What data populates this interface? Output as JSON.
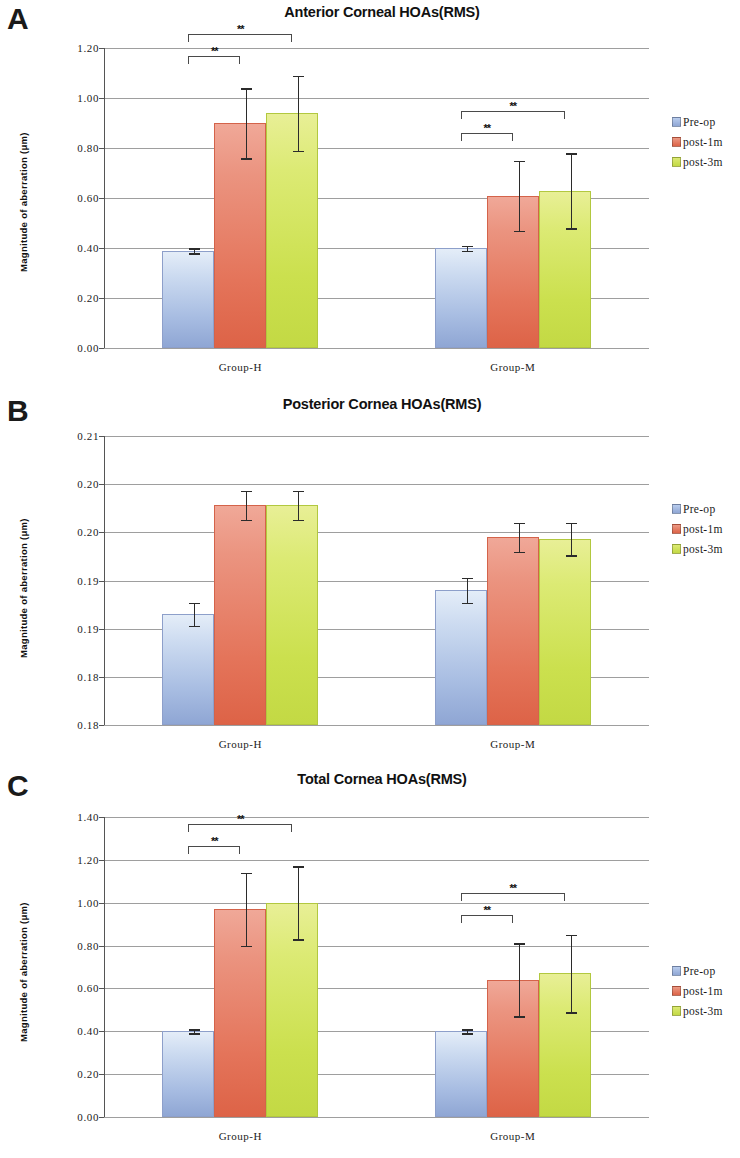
{
  "figure": {
    "panels": [
      "A",
      "B",
      "C"
    ],
    "series_names": [
      "Pre-op",
      "post-1m",
      "post-3m"
    ],
    "legend_labels": {
      "pre": "Pre-op",
      "p1m": "post-1m",
      "p3m": "post-3m"
    },
    "colors": {
      "pre_op": "#a8bde2",
      "post_1m": "#e4745a",
      "post_3m": "#cbe04e"
    },
    "significance_marker": "**",
    "ylabel": "Magnitude of aberration (μm)",
    "categories": [
      "Group-H",
      "Group-M"
    ]
  },
  "panel_a": {
    "letter": "A",
    "title": "Anterior Corneal HOAs(RMS)",
    "ylabel": "Magnitude of aberration (μm)",
    "ticks": [
      "1.20",
      "1.00",
      "0.80",
      "0.60",
      "0.40",
      "0.20",
      "0.00"
    ],
    "cat_h": "Group-H",
    "cat_m": "Group-M"
  },
  "panel_b": {
    "letter": "B",
    "title": "Posterior Cornea HOAs(RMS)",
    "ylabel": "Magnitude of aberration (μm)",
    "ticks": [
      "0.21",
      "0.20",
      "0.20",
      "0.19",
      "0.19",
      "0.18",
      "0.18"
    ],
    "cat_h": "Group-H",
    "cat_m": "Group-M"
  },
  "panel_c": {
    "letter": "C",
    "title": "Total Cornea HOAs(RMS)",
    "ylabel": "Magnitude of aberration (μm)",
    "ticks": [
      "1.40",
      "1.20",
      "1.00",
      "0.80",
      "0.60",
      "0.40",
      "0.20",
      "0.00"
    ],
    "cat_h": "Group-H",
    "cat_m": "Group-M"
  },
  "chart_data": [
    {
      "panel": "A",
      "type": "bar",
      "title": "Anterior Corneal HOAs(RMS)",
      "xlabel": "",
      "ylabel": "Magnitude of aberration (μm)",
      "ylim": [
        0.0,
        1.2
      ],
      "ytick_values": [
        0.0,
        0.2,
        0.4,
        0.6,
        0.8,
        1.0,
        1.2
      ],
      "ytick_labels": [
        "0.00",
        "0.20",
        "0.40",
        "0.60",
        "0.80",
        "1.00",
        "1.20"
      ],
      "grid": true,
      "legend": "right",
      "categories": [
        "Group-H",
        "Group-M"
      ],
      "series": [
        {
          "name": "Pre-op",
          "values": [
            0.39,
            0.4
          ],
          "errors": [
            0.01,
            0.01
          ]
        },
        {
          "name": "post-1m",
          "values": [
            0.9,
            0.61
          ],
          "errors": [
            0.14,
            0.14
          ]
        },
        {
          "name": "post-3m",
          "values": [
            0.94,
            0.63
          ],
          "errors": [
            0.15,
            0.15
          ]
        }
      ],
      "annotations": [
        {
          "text": "**",
          "from": "Group-H Pre-op",
          "to": "Group-H post-1m"
        },
        {
          "text": "**",
          "from": "Group-H Pre-op",
          "to": "Group-H post-3m"
        },
        {
          "text": "**",
          "from": "Group-M Pre-op",
          "to": "Group-M post-1m"
        },
        {
          "text": "**",
          "from": "Group-M Pre-op",
          "to": "Group-M post-3m"
        }
      ]
    },
    {
      "panel": "B",
      "type": "bar",
      "title": "Posterior Cornea HOAs(RMS)",
      "xlabel": "",
      "ylabel": "Magnitude of aberration (μm)",
      "ylim": [
        0.18,
        0.21
      ],
      "ytick_values": [
        0.18,
        0.185,
        0.19,
        0.195,
        0.2,
        0.205,
        0.21
      ],
      "ytick_labels": [
        "0.18",
        "0.18",
        "0.19",
        "0.19",
        "0.20",
        "0.20",
        "0.21"
      ],
      "grid": true,
      "legend": "right",
      "categories": [
        "Group-H",
        "Group-M"
      ],
      "series": [
        {
          "name": "Pre-op",
          "values": [
            0.1915,
            0.194
          ],
          "errors": [
            0.0012,
            0.0013
          ]
        },
        {
          "name": "post-1m",
          "values": [
            0.2028,
            0.1995
          ],
          "errors": [
            0.0015,
            0.0015
          ]
        },
        {
          "name": "post-3m",
          "values": [
            0.2028,
            0.1993
          ],
          "errors": [
            0.0015,
            0.0017
          ]
        }
      ],
      "annotations": []
    },
    {
      "panel": "C",
      "type": "bar",
      "title": "Total Cornea HOAs(RMS)",
      "xlabel": "",
      "ylabel": "Magnitude of aberration (μm)",
      "ylim": [
        0.0,
        1.4
      ],
      "ytick_values": [
        0.0,
        0.2,
        0.4,
        0.6,
        0.8,
        1.0,
        1.2,
        1.4
      ],
      "ytick_labels": [
        "0.00",
        "0.20",
        "0.40",
        "0.60",
        "0.80",
        "1.00",
        "1.20",
        "1.40"
      ],
      "grid": true,
      "legend": "right",
      "categories": [
        "Group-H",
        "Group-M"
      ],
      "series": [
        {
          "name": "Pre-op",
          "values": [
            0.4,
            0.4
          ],
          "errors": [
            0.01,
            0.01
          ]
        },
        {
          "name": "post-1m",
          "values": [
            0.97,
            0.64
          ],
          "errors": [
            0.17,
            0.17
          ]
        },
        {
          "name": "post-3m",
          "values": [
            1.0,
            0.67
          ],
          "errors": [
            0.17,
            0.18
          ]
        }
      ],
      "annotations": [
        {
          "text": "**",
          "from": "Group-H Pre-op",
          "to": "Group-H post-1m"
        },
        {
          "text": "**",
          "from": "Group-H Pre-op",
          "to": "Group-H post-3m"
        },
        {
          "text": "**",
          "from": "Group-M Pre-op",
          "to": "Group-M post-1m"
        },
        {
          "text": "**",
          "from": "Group-M Pre-op",
          "to": "Group-M post-3m"
        }
      ]
    }
  ]
}
